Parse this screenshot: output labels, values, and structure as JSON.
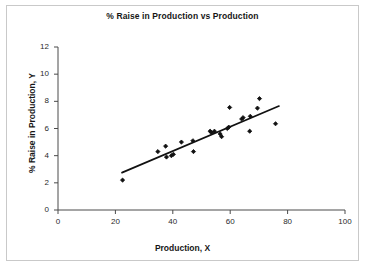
{
  "figure": {
    "width": 365,
    "height": 267,
    "background_color": "#ffffff",
    "border_color": "#c9c9c9",
    "ink_color": "#161616"
  },
  "chart_data": {
    "type": "scatter",
    "title": "% Raise in Production vs Production",
    "xlabel": "Production, X",
    "ylabel": "% Raise in Production, Y",
    "xlim": [
      0,
      100
    ],
    "ylim": [
      0,
      12
    ],
    "xticks": [
      0,
      20,
      40,
      60,
      80,
      100
    ],
    "yticks": [
      0,
      2,
      4,
      6,
      8,
      10,
      12
    ],
    "grid": false,
    "legend": "none",
    "marker": "diamond",
    "marker_color": "#111111",
    "series": [
      {
        "name": "observations",
        "points": [
          [
            22.5,
            2.2
          ],
          [
            34.8,
            4.3
          ],
          [
            37.5,
            4.7
          ],
          [
            37.8,
            3.9
          ],
          [
            39.5,
            4.0
          ],
          [
            40.2,
            4.1
          ],
          [
            43.0,
            5.0
          ],
          [
            47.0,
            5.1
          ],
          [
            47.2,
            4.3
          ],
          [
            53.0,
            5.8
          ],
          [
            53.5,
            5.7
          ],
          [
            54.5,
            5.8
          ],
          [
            56.5,
            5.6
          ],
          [
            57.0,
            5.4
          ],
          [
            59.0,
            6.0
          ],
          [
            59.5,
            6.1
          ],
          [
            59.8,
            7.55
          ],
          [
            64.0,
            6.7
          ],
          [
            64.5,
            6.8
          ],
          [
            66.8,
            5.8
          ],
          [
            67.0,
            6.9
          ],
          [
            69.5,
            7.5
          ],
          [
            70.2,
            8.2
          ],
          [
            75.8,
            6.35
          ]
        ]
      }
    ],
    "trendline": {
      "name": "least-squares fit",
      "x_start": 22.3,
      "y_start": 2.75,
      "x_end": 77.0,
      "y_end": 7.65,
      "color": "#111111"
    }
  }
}
